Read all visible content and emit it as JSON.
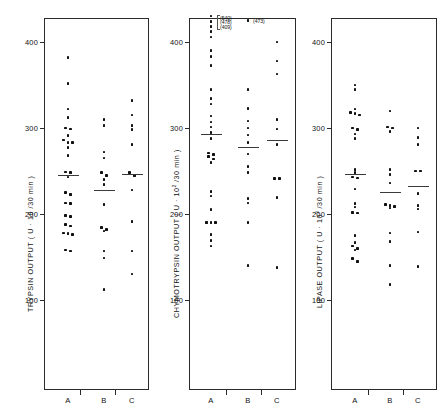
{
  "figure": {
    "type": "dot-plot-group",
    "panel_count": 3,
    "background": "#ffffff",
    "dot_color": "#101010",
    "axis_color": "#2b2b2b"
  },
  "chart_data": [
    {
      "type": "scatter",
      "title": "",
      "ylabel": "TRYPSIN  OUTPUT  ( U · 10 /30 min )",
      "ylabel_text": "TRYPSIN OUTPUT (U·10/30 min)",
      "xlabel": "",
      "ylim": [
        60,
        430
      ],
      "yticks": [
        100,
        200,
        300,
        400
      ],
      "ytick_labels": [
        "100",
        "200",
        "300",
        "400"
      ],
      "grid": false,
      "legend": "none",
      "categories": [
        "A",
        "B",
        "C"
      ],
      "series": [
        {
          "name": "A",
          "values": [
            382,
            352,
            322,
            312,
            300,
            299,
            291,
            286,
            283,
            283,
            277,
            268,
            249,
            248,
            243,
            225,
            223,
            213,
            212,
            198,
            197,
            188,
            186,
            178,
            177,
            176,
            158,
            157
          ],
          "mean": 245
        },
        {
          "name": "B",
          "values": [
            310,
            303,
            272,
            265,
            248,
            245,
            240,
            234,
            211,
            184,
            182,
            180,
            157,
            149,
            112
          ],
          "mean": 228
        },
        {
          "name": "C",
          "values": [
            332,
            315,
            303,
            298,
            281,
            248,
            245,
            228,
            191,
            157,
            130
          ],
          "mean": 246
        }
      ]
    },
    {
      "type": "scatter",
      "title": "",
      "ylabel": "CHYMOTRYPSIN  OUTPUT  ( U · 10² /30 min )",
      "ylabel_text": "CHYMOTRYPSIN OUTPUT (U·10^2/30 min)",
      "xlabel": "",
      "ylim": [
        60,
        445
      ],
      "yticks": [
        100,
        200,
        300,
        400
      ],
      "ytick_labels": [
        "100",
        "200",
        "300",
        "400"
      ],
      "grid": false,
      "legend": "none",
      "categories": [
        "A",
        "B",
        "C"
      ],
      "annotations": [
        {
          "text": "(540)",
          "series": "A",
          "note": "off-scale value plotted at top"
        },
        {
          "text": "(478)",
          "series": "A",
          "note": "off-scale value plotted at top"
        },
        {
          "text": "(409)",
          "series": "A",
          "note": "off-scale value plotted at top"
        },
        {
          "text": "(473)",
          "series": "B",
          "note": "off-scale value plotted at top"
        }
      ],
      "series": [
        {
          "name": "A",
          "values": [
            430,
            424,
            418,
            412,
            406,
            390,
            383,
            373,
            345,
            334,
            328,
            314,
            307,
            301,
            295,
            288,
            271,
            269,
            267,
            264,
            260,
            226,
            221,
            205,
            190,
            190,
            190,
            176,
            169,
            163
          ],
          "mean": 293
        },
        {
          "name": "B",
          "values": [
            425,
            345,
            323,
            308,
            300,
            292,
            283,
            270,
            255,
            248,
            218,
            213,
            190,
            140
          ],
          "mean": 278
        },
        {
          "name": "C",
          "values": [
            400,
            378,
            363,
            310,
            299,
            281,
            241,
            241,
            219,
            138
          ],
          "mean": 286
        }
      ]
    },
    {
      "type": "scatter",
      "title": "",
      "ylabel": "LIPASE  OUTPUT  ( U · 10³ /30 min )",
      "ylabel_text": "LIPASE OUTPUT (U·10^3/30 min)",
      "xlabel": "",
      "ylim": [
        60,
        430
      ],
      "yticks": [
        100,
        200,
        300,
        400
      ],
      "ytick_labels": [
        "100",
        "200",
        "300",
        "400"
      ],
      "grid": false,
      "legend": "none",
      "categories": [
        "A",
        "B",
        "C"
      ],
      "series": [
        {
          "name": "A",
          "values": [
            350,
            345,
            322,
            318,
            317,
            315,
            300,
            298,
            293,
            288,
            252,
            248,
            243,
            242,
            229,
            212,
            208,
            202,
            201,
            175,
            167,
            163,
            160,
            158,
            148,
            145
          ],
          "mean": 247
        },
        {
          "name": "B",
          "values": [
            320,
            301,
            300,
            296,
            252,
            246,
            236,
            211,
            210,
            209,
            207,
            178,
            168,
            140,
            118
          ],
          "mean": 226
        },
        {
          "name": "C",
          "values": [
            300,
            289,
            281,
            250,
            250,
            224,
            210,
            206,
            179,
            139
          ],
          "mean": 233
        }
      ]
    }
  ],
  "panels": [
    {
      "id": "trypsin",
      "axis_title_part1": "TRYPSIN   OUTPUT   ( U · 10 /30 min )",
      "superscript": "",
      "ytick_labels": [
        "400",
        "300",
        "200",
        "100"
      ],
      "xtick_labels": [
        "A",
        "B",
        "C"
      ]
    },
    {
      "id": "chymotrypsin",
      "axis_title_part1": "CHYMOTRYPSIN   OUTPUT   ( U · 10",
      "superscript": "2",
      "axis_title_part2": " /30 min )",
      "ytick_labels": [
        "400",
        "300",
        "200",
        "100"
      ],
      "xtick_labels": [
        "A",
        "B",
        "C"
      ],
      "outlier_labels": [
        "(540)",
        "(478)",
        "(409)"
      ],
      "outlier_label_b": "(473)"
    },
    {
      "id": "lipase",
      "axis_title_part1": "LIPASE OUTPUT   ( U · 10",
      "superscript": "3",
      "axis_title_part2": " /30 min )",
      "ytick_labels": [
        "400",
        "300",
        "200",
        "100"
      ],
      "xtick_labels": [
        "A",
        "B",
        "C"
      ]
    }
  ]
}
